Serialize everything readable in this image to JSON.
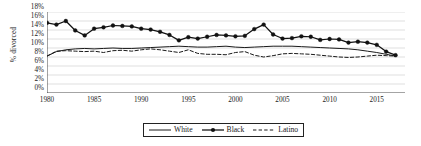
{
  "chart_data": {
    "type": "line",
    "title": "",
    "xlabel": "",
    "ylabel": "% divorced",
    "xlim": [
      1980,
      2018
    ],
    "ylim": [
      0,
      18
    ],
    "grid": true,
    "grid_axis": "y",
    "legend_position": "bottom-center",
    "x": [
      1980,
      1981,
      1982,
      1983,
      1984,
      1985,
      1986,
      1987,
      1988,
      1989,
      1990,
      1991,
      1992,
      1993,
      1994,
      1995,
      1996,
      1997,
      1998,
      1999,
      2000,
      2001,
      2002,
      2003,
      2004,
      2005,
      2006,
      2007,
      2008,
      2009,
      2010,
      2011,
      2012,
      2013,
      2014,
      2015,
      2016,
      2017
    ],
    "xticks": [
      1980,
      1985,
      1990,
      1995,
      2000,
      2005,
      2010,
      2015
    ],
    "yticks": [
      0,
      2,
      4,
      6,
      8,
      10,
      12,
      14,
      16,
      18
    ],
    "ytick_labels": [
      "0%",
      "2%",
      "4%",
      "6%",
      "8%",
      "10%",
      "12%",
      "14%",
      "16%",
      "18%"
    ],
    "series": [
      {
        "name": "White",
        "style": "solid",
        "marker": "none",
        "color": "#1a1a1a",
        "values": [
          8.2,
          9.2,
          9.6,
          9.8,
          9.9,
          9.8,
          9.9,
          10.0,
          9.9,
          9.9,
          10.0,
          10.1,
          10.2,
          10.3,
          10.4,
          10.3,
          10.2,
          10.2,
          10.3,
          10.4,
          10.2,
          10.1,
          10.2,
          10.3,
          10.4,
          10.4,
          10.4,
          10.3,
          10.2,
          10.1,
          10.0,
          9.9,
          9.8,
          9.6,
          9.3,
          9.0,
          8.6,
          8.2
        ]
      },
      {
        "name": "Black",
        "style": "solid",
        "marker": "circle",
        "color": "#111111",
        "values": [
          15.6,
          15.2,
          16.0,
          13.9,
          12.8,
          14.3,
          14.6,
          15.0,
          14.9,
          14.8,
          14.3,
          14.1,
          13.6,
          12.9,
          11.7,
          12.4,
          12.1,
          12.5,
          12.9,
          12.8,
          12.6,
          12.7,
          14.2,
          15.2,
          13.0,
          12.1,
          12.2,
          12.6,
          12.5,
          11.8,
          12.0,
          11.9,
          11.2,
          11.4,
          11.2,
          10.7,
          9.2,
          8.4
        ]
      },
      {
        "name": "Latino",
        "style": "dashed",
        "marker": "none",
        "color": "#1a1a1a",
        "values": [
          8.2,
          9.3,
          9.4,
          9.3,
          9.2,
          9.3,
          9.0,
          9.4,
          9.5,
          9.3,
          9.6,
          9.8,
          9.6,
          9.3,
          9.0,
          9.6,
          8.8,
          8.6,
          8.6,
          8.5,
          9.0,
          9.2,
          8.4,
          8.0,
          8.3,
          8.7,
          8.8,
          8.7,
          8.6,
          8.4,
          8.2,
          8.0,
          7.9,
          8.0,
          8.2,
          8.4,
          8.3,
          8.2
        ]
      }
    ]
  },
  "legend": {
    "entries": [
      {
        "label": "White"
      },
      {
        "label": "Black"
      },
      {
        "label": "Latino"
      }
    ]
  }
}
